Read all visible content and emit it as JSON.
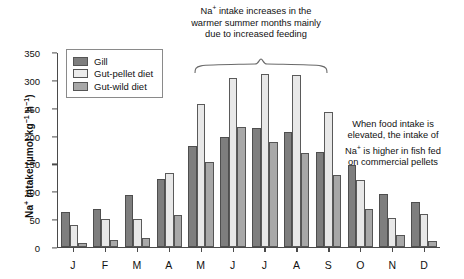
{
  "chart_data": {
    "type": "bar",
    "title": "",
    "xlabel": "",
    "ylabel": "Na+ intake (µmol kg-1 h-1)",
    "ylabel_parts": {
      "prefix": "Na",
      "sup1": "+",
      "mid": " intake (µmol kg",
      "sup2": "−1",
      "mid2": " h",
      "sup3": "−1",
      "suffix": ")"
    },
    "ylim": [
      0,
      350
    ],
    "yticks": [
      0,
      50,
      100,
      150,
      200,
      250,
      300,
      350
    ],
    "grid": false,
    "legend_position": "top-left",
    "categories": [
      "J",
      "F",
      "M",
      "A",
      "M",
      "J",
      "J",
      "A",
      "S",
      "O",
      "N",
      "D"
    ],
    "series": [
      {
        "name": "Gill",
        "color": "#7e7e7e",
        "values": [
          62,
          68,
          93,
          122,
          181,
          197,
          214,
          206,
          170,
          148,
          95,
          80
        ]
      },
      {
        "name": "Gut-pellet diet",
        "color": "#ececec",
        "values": [
          40,
          50,
          50,
          133,
          257,
          303,
          310,
          309,
          242,
          121,
          52,
          60
        ]
      },
      {
        "name": "Gut-wild diet",
        "color": "#a8a8a8",
        "values": [
          8,
          13,
          16,
          58,
          152,
          215,
          189,
          168,
          129,
          68,
          22,
          10
        ]
      }
    ]
  },
  "legend": {
    "items": [
      {
        "label": "Gill"
      },
      {
        "label": "Gut-pellet diet"
      },
      {
        "label": "Gut-wild diet"
      }
    ]
  },
  "annotations": {
    "top": {
      "line1_a": "Na",
      "line1_sup": "+",
      "line1_b": " intake increases in the",
      "line2": "warmer summer months mainly",
      "line3": "due to increased feeding"
    },
    "right": {
      "line1": "When food intake is",
      "line2": "elevated, the intake of",
      "line3_a": "Na",
      "line3_sup": "+",
      "line3_b": " is higher in fish fed",
      "line4": "on commercial pellets"
    }
  }
}
